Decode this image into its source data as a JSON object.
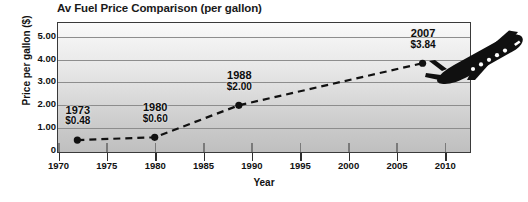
{
  "chart_data": {
    "type": "line",
    "title": "Av Fuel Price Comparison (per gallon)",
    "xlabel": "Year",
    "ylabel": "Price per gallon ($)",
    "xlim": [
      1970,
      2012.5
    ],
    "ylim": [
      0,
      5.6
    ],
    "grid": true,
    "legend": false,
    "x_ticks": [
      "1970",
      "1975",
      "1980",
      "1985",
      "1990",
      "1995",
      "2000",
      "2005",
      "2010"
    ],
    "x_tick_values": [
      1970,
      1975,
      1980,
      1985,
      1990,
      1995,
      2000,
      2005,
      2010
    ],
    "y_ticks": [
      "0",
      "1.00",
      "2.00",
      "3.00",
      "4.00",
      "5.00"
    ],
    "y_tick_values": [
      0,
      1,
      2,
      3,
      4,
      5
    ],
    "series": [
      {
        "name": "Av Fuel Price",
        "x": [
          1972,
          1980,
          1988.7,
          2007.7
        ],
        "values": [
          0.48,
          0.6,
          2.0,
          3.84
        ],
        "line_style": "dashed",
        "marker": "circle",
        "color": "#111111"
      }
    ],
    "annotations": [
      {
        "year_label": "1973",
        "value_label": "$0.48",
        "x": 1972,
        "y": 0.48
      },
      {
        "year_label": "1980",
        "value_label": "$0.60",
        "x": 1980,
        "y": 0.6
      },
      {
        "year_label": "1988",
        "value_label": "$2.00",
        "x": 1988.7,
        "y": 2.0
      },
      {
        "year_label": "2007",
        "value_label": "$3.84",
        "x": 2007.7,
        "y": 3.84
      }
    ],
    "decorations": [
      {
        "name": "airplane-icon",
        "description": "black airplane silhouette"
      }
    ],
    "colors": {
      "line": "#111111",
      "marker": "#111111",
      "gridline": "#8d8d8d",
      "border": "#3a3a3a",
      "plot_background_top": "#fafafa",
      "plot_background_bottom": "#bfbfbf",
      "text": "#111111",
      "page_background": "#ffffff"
    }
  }
}
